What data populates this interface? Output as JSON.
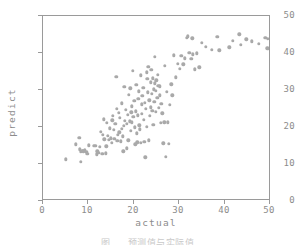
{
  "figure": {
    "caption_partial": "图   预测值与实际值"
  },
  "chart_data": {
    "type": "scatter",
    "title": "",
    "xlabel": "actual",
    "ylabel": "predict",
    "xlim": [
      0,
      50
    ],
    "ylim": [
      0,
      50
    ],
    "xticks": [
      0,
      10,
      20,
      30,
      40,
      50
    ],
    "yticks": [
      0,
      10,
      20,
      30,
      40,
      50
    ],
    "grid": false,
    "legend": null,
    "marker": {
      "shape": "circle",
      "color": "#a9a9a9",
      "size_px": 3.4
    },
    "series": [
      {
        "name": "predicted vs actual",
        "points": [
          [
            5.0,
            10.8
          ],
          [
            7.2,
            14.9
          ],
          [
            8.0,
            16.8
          ],
          [
            8.2,
            13.6
          ],
          [
            8.3,
            12.9
          ],
          [
            8.4,
            10.2
          ],
          [
            8.7,
            13.2
          ],
          [
            9.3,
            13.4
          ],
          [
            9.6,
            12.9
          ],
          [
            10.2,
            14.7
          ],
          [
            11.2,
            14.6
          ],
          [
            11.9,
            12.2
          ],
          [
            12.3,
            12.6
          ],
          [
            12.6,
            14.2
          ],
          [
            12.8,
            18.3
          ],
          [
            13.1,
            12.4
          ],
          [
            13.4,
            21.8
          ],
          [
            13.6,
            16.3
          ],
          [
            13.9,
            12.5
          ],
          [
            14.1,
            20.9
          ],
          [
            14.3,
            17.3
          ],
          [
            14.6,
            16.1
          ],
          [
            14.8,
            19.3
          ],
          [
            15.0,
            16.6
          ],
          [
            15.2,
            15.4
          ],
          [
            15.3,
            21.5
          ],
          [
            15.6,
            18.9
          ],
          [
            15.8,
            16.4
          ],
          [
            16.0,
            20.6
          ],
          [
            16.2,
            33.4
          ],
          [
            16.4,
            15.9
          ],
          [
            16.6,
            17.5
          ],
          [
            16.8,
            23.5
          ],
          [
            17.0,
            22.2
          ],
          [
            17.2,
            15.8
          ],
          [
            17.4,
            19.2
          ],
          [
            17.6,
            17.1
          ],
          [
            17.8,
            13.0
          ],
          [
            18.0,
            30.7
          ],
          [
            18.1,
            21.4
          ],
          [
            18.3,
            24.3
          ],
          [
            18.5,
            20.5
          ],
          [
            18.7,
            23.0
          ],
          [
            18.9,
            16.0
          ],
          [
            19.0,
            28.5
          ],
          [
            19.2,
            21.2
          ],
          [
            19.4,
            18.7
          ],
          [
            19.6,
            25.3
          ],
          [
            19.7,
            21.0
          ],
          [
            19.9,
            35.1
          ],
          [
            20.0,
            22.4
          ],
          [
            20.2,
            26.8
          ],
          [
            20.3,
            19.6
          ],
          [
            20.5,
            24.0
          ],
          [
            20.6,
            31.2
          ],
          [
            20.8,
            17.9
          ],
          [
            21.0,
            22.9
          ],
          [
            21.1,
            27.4
          ],
          [
            21.3,
            20.1
          ],
          [
            21.4,
            19.0
          ],
          [
            21.6,
            33.8
          ],
          [
            21.8,
            25.9
          ],
          [
            21.9,
            23.3
          ],
          [
            22.0,
            28.2
          ],
          [
            22.2,
            30.4
          ],
          [
            22.3,
            21.6
          ],
          [
            22.5,
            26.2
          ],
          [
            22.6,
            11.4
          ],
          [
            22.8,
            24.6
          ],
          [
            22.9,
            34.6
          ],
          [
            23.0,
            19.8
          ],
          [
            23.2,
            29.1
          ],
          [
            23.3,
            36.1
          ],
          [
            23.5,
            27.0
          ],
          [
            23.6,
            22.7
          ],
          [
            23.8,
            31.9
          ],
          [
            23.9,
            25.1
          ],
          [
            24.0,
            35.3
          ],
          [
            24.1,
            28.8
          ],
          [
            24.3,
            33.0
          ],
          [
            24.4,
            20.3
          ],
          [
            24.5,
            30.0
          ],
          [
            24.6,
            26.5
          ],
          [
            24.8,
            38.9
          ],
          [
            24.9,
            23.8
          ],
          [
            25.0,
            29.6
          ],
          [
            25.1,
            32.4
          ],
          [
            25.3,
            27.7
          ],
          [
            25.4,
            34.0
          ],
          [
            25.5,
            31.0
          ],
          [
            25.6,
            24.9
          ],
          [
            25.8,
            28.3
          ],
          [
            26.0,
            20.8
          ],
          [
            26.2,
            26.0
          ],
          [
            26.4,
            23.4
          ],
          [
            26.6,
            15.2
          ],
          [
            26.8,
            21.0
          ],
          [
            27.0,
            36.4
          ],
          [
            27.2,
            11.5
          ],
          [
            27.4,
            29.3
          ],
          [
            27.6,
            21.0
          ],
          [
            27.9,
            15.1
          ],
          [
            28.0,
            25.7
          ],
          [
            28.4,
            31.3
          ],
          [
            28.6,
            28.3
          ],
          [
            29.0,
            39.3
          ],
          [
            29.4,
            33.2
          ],
          [
            29.8,
            37.0
          ],
          [
            30.2,
            35.6
          ],
          [
            30.6,
            39.1
          ],
          [
            31.0,
            36.8
          ],
          [
            31.4,
            38.4
          ],
          [
            31.8,
            44.1
          ],
          [
            32.0,
            44.5
          ],
          [
            32.4,
            40.0
          ],
          [
            32.8,
            38.3
          ],
          [
            33.0,
            43.9
          ],
          [
            33.2,
            39.5
          ],
          [
            33.6,
            35.4
          ],
          [
            34.0,
            39.8
          ],
          [
            34.6,
            36.0
          ],
          [
            35.2,
            42.7
          ],
          [
            36.0,
            41.6
          ],
          [
            37.4,
            40.8
          ],
          [
            38.6,
            44.3
          ],
          [
            39.0,
            40.6
          ],
          [
            41.2,
            41.4
          ],
          [
            42.0,
            43.2
          ],
          [
            43.4,
            45.0
          ],
          [
            43.8,
            42.1
          ],
          [
            45.0,
            43.6
          ],
          [
            46.2,
            43.1
          ],
          [
            47.8,
            42.4
          ],
          [
            49.2,
            44.0
          ],
          [
            49.6,
            41.2
          ],
          [
            49.8,
            43.8
          ],
          [
            12.0,
            13.0
          ],
          [
            14.0,
            14.4
          ],
          [
            16.3,
            24.7
          ],
          [
            17.5,
            26.1
          ],
          [
            19.3,
            30.2
          ],
          [
            20.9,
            15.5
          ],
          [
            21.7,
            15.4
          ],
          [
            22.4,
            15.6
          ],
          [
            23.4,
            16.0
          ],
          [
            24.7,
            31.6
          ],
          [
            25.9,
            30.8
          ],
          [
            18.6,
            13.9
          ],
          [
            20.4,
            14.9
          ],
          [
            15.4,
            22.8
          ],
          [
            13.2,
            17.6
          ],
          [
            11.6,
            14.5
          ],
          [
            9.8,
            12.4
          ],
          [
            8.9,
            13.0
          ],
          [
            24.2,
            24.1
          ],
          [
            23.1,
            32.8
          ],
          [
            21.2,
            29.4
          ],
          [
            19.5,
            23.7
          ],
          [
            17.9,
            20.0
          ],
          [
            16.9,
            18.2
          ]
        ]
      }
    ]
  }
}
